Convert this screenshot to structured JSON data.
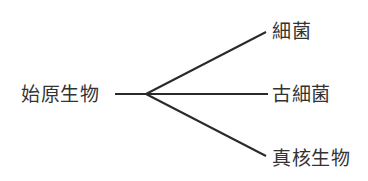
{
  "diagram": {
    "type": "tree",
    "root": {
      "label": "始原生物"
    },
    "branches": [
      {
        "label": "細菌"
      },
      {
        "label": "古細菌"
      },
      {
        "label": "真核生物"
      }
    ],
    "colors": {
      "line": "#2a2a2a",
      "text": "#333333",
      "background": "#ffffff"
    }
  }
}
